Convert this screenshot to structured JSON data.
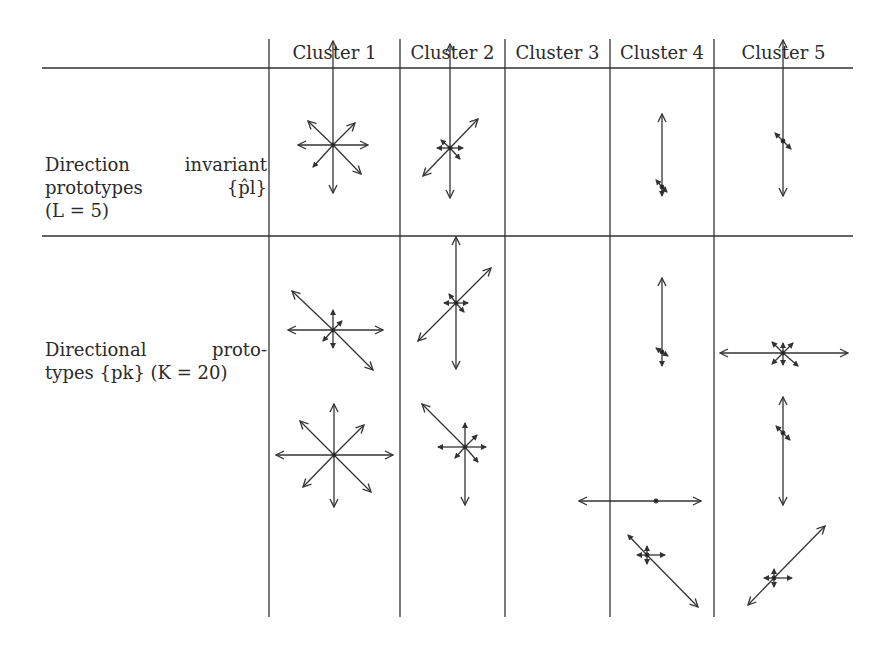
{
  "table": {
    "headers": [
      "Cluster 1",
      "Cluster 2",
      "Cluster 3",
      "Cluster 4",
      "Cluster 5"
    ],
    "rows": [
      {
        "label_lines": [
          "Direction invariant",
          "prototypes {p̂l}",
          "(L = 5)"
        ]
      },
      {
        "label_lines": [
          "Directional proto-",
          "types {pk} (K = 20)"
        ]
      }
    ]
  }
}
